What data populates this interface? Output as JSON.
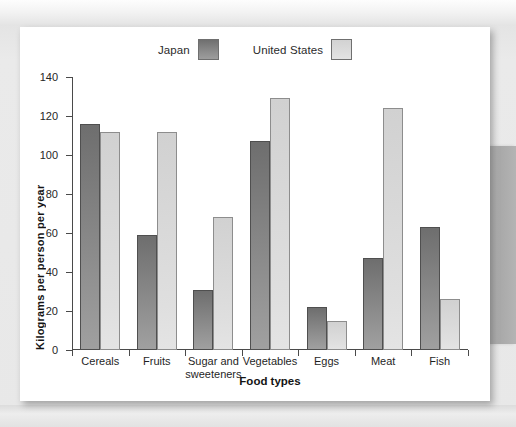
{
  "chart_data": {
    "type": "bar",
    "title": "",
    "xlabel": "Food types",
    "ylabel": "Kilograms per person per year",
    "ylim": [
      0,
      140
    ],
    "yticks": [
      0,
      20,
      40,
      60,
      80,
      100,
      120,
      140
    ],
    "grid": false,
    "legend_position": "top-center",
    "categories": [
      "Cereals",
      "Fruits",
      "Sugar and\nsweeteners",
      "Vegetables",
      "Eggs",
      "Meat",
      "Fish"
    ],
    "series": [
      {
        "name": "Japan",
        "color": "#808080",
        "values": [
          116,
          59,
          31,
          107,
          22,
          47,
          63
        ]
      },
      {
        "name": "United States",
        "color": "#d8d8d8",
        "values": [
          112,
          112,
          68,
          129,
          15,
          124,
          26
        ]
      }
    ]
  },
  "legend": {
    "entries": [
      {
        "label": "Japan",
        "swatch": "japan-swatch"
      },
      {
        "label": "United States",
        "swatch": "united-states-swatch"
      }
    ]
  },
  "axes": {
    "y_title": "Kilograms per person per year",
    "x_title": "Food types",
    "y_tick_labels": [
      "140",
      "120",
      "100",
      "80",
      "60",
      "40",
      "20",
      "0"
    ]
  },
  "colors": {
    "japan_bar": "#808080",
    "us_bar": "#d8d8d8",
    "axis": "#4a4a4a",
    "page": "#ffffff",
    "backdrop": "#e8e8e8"
  }
}
